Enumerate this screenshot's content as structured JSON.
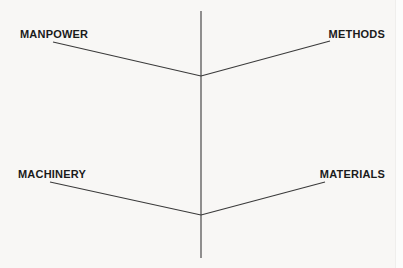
{
  "diagram": {
    "type": "fishbone-ishikawa-skeleton",
    "title": "",
    "background_color": "#f8f7f5",
    "line_color": "#3a3a3a",
    "text_color": "#1b1b1b",
    "canvas": {
      "width": 403,
      "height": 268
    },
    "spine": {
      "name": "vertical-spine",
      "x": 201,
      "y_top": 11,
      "y_bottom": 258
    },
    "vertices": {
      "upper": {
        "x": 201,
        "y": 76
      },
      "lower": {
        "x": 201,
        "y": 215
      }
    },
    "branches": [
      {
        "id": "manpower",
        "label": "MANPOWER",
        "position": "top-left",
        "from": {
          "x": 53,
          "y": 42
        },
        "to": {
          "x": 201,
          "y": 76
        }
      },
      {
        "id": "methods",
        "label": "METHODS",
        "position": "top-right",
        "from": {
          "x": 201,
          "y": 76
        },
        "to": {
          "x": 330,
          "y": 41
        }
      },
      {
        "id": "machinery",
        "label": "MACHINERY",
        "position": "bottom-left",
        "from": {
          "x": 50,
          "y": 182
        },
        "to": {
          "x": 201,
          "y": 215
        }
      },
      {
        "id": "materials",
        "label": "MATERIALS",
        "position": "bottom-right",
        "from": {
          "x": 201,
          "y": 215
        },
        "to": {
          "x": 325,
          "y": 182
        }
      }
    ]
  },
  "labels": {
    "manpower": "MANPOWER",
    "methods": "METHODS",
    "machinery": "MACHINERY",
    "materials": "MATERIALS"
  }
}
